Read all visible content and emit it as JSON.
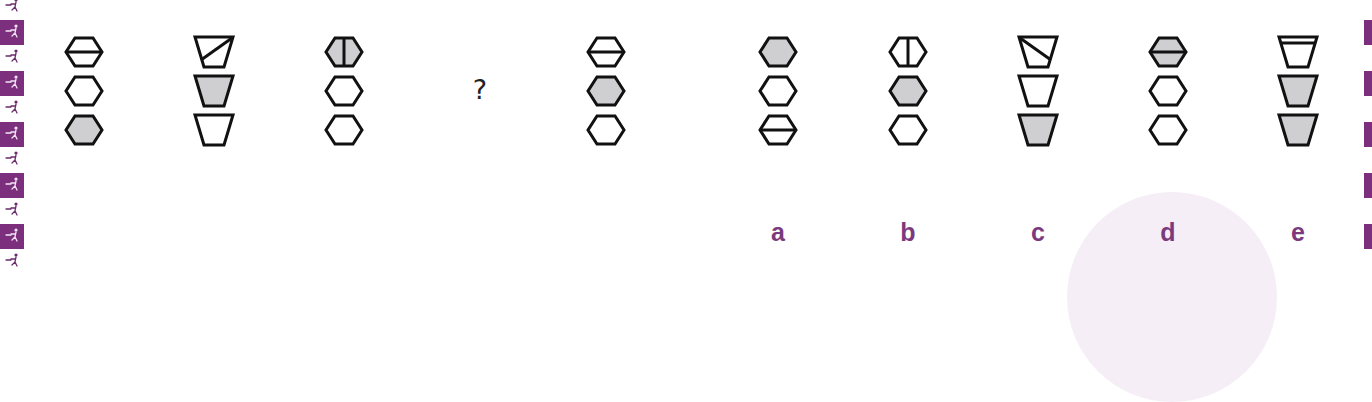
{
  "colors": {
    "accent": "#7b3a7e",
    "strip_purple": "#7b2f7d",
    "shape_fill_gray": "#cfcfd2",
    "shape_stroke": "#111111",
    "circle_bg": "#f6eef7"
  },
  "question": {
    "sequence": [
      {
        "id": "seq-1",
        "shapes": [
          {
            "type": "hexagon",
            "fill": "none",
            "line": "horizontal",
            "half_fill": null
          },
          {
            "type": "hexagon",
            "fill": "none",
            "line": null,
            "half_fill": null
          },
          {
            "type": "hexagon",
            "fill": "gray",
            "line": null,
            "half_fill": null
          }
        ]
      },
      {
        "id": "seq-2",
        "shapes": [
          {
            "type": "trapezoid",
            "fill": "none",
            "line": "diagonal-tr-bl",
            "half_fill": null
          },
          {
            "type": "trapezoid",
            "fill": "gray",
            "line": null,
            "half_fill": null
          },
          {
            "type": "trapezoid",
            "fill": "none",
            "line": null,
            "half_fill": null
          }
        ]
      },
      {
        "id": "seq-3",
        "shapes": [
          {
            "type": "hexagon",
            "fill": "gray",
            "line": "vertical",
            "half_fill": null
          },
          {
            "type": "hexagon",
            "fill": "none",
            "line": null,
            "half_fill": null
          },
          {
            "type": "hexagon",
            "fill": "none",
            "line": null,
            "half_fill": null
          }
        ]
      }
    ],
    "missing_symbol": "?",
    "after": [
      {
        "id": "seq-5",
        "shapes": [
          {
            "type": "hexagon",
            "fill": "none",
            "line": "horizontal",
            "half_fill": null
          },
          {
            "type": "hexagon",
            "fill": "gray",
            "line": null,
            "half_fill": null
          },
          {
            "type": "hexagon",
            "fill": "none",
            "line": null,
            "half_fill": null
          }
        ]
      }
    ]
  },
  "options": [
    {
      "label": "a",
      "shapes": [
        {
          "type": "hexagon",
          "fill": "gray",
          "line": null
        },
        {
          "type": "hexagon",
          "fill": "none",
          "line": null
        },
        {
          "type": "hexagon",
          "fill": "none",
          "line": "horizontal"
        }
      ]
    },
    {
      "label": "b",
      "shapes": [
        {
          "type": "hexagon",
          "fill": "none",
          "line": "vertical"
        },
        {
          "type": "hexagon",
          "fill": "gray",
          "line": null
        },
        {
          "type": "hexagon",
          "fill": "none",
          "line": null
        }
      ]
    },
    {
      "label": "c",
      "shapes": [
        {
          "type": "trapezoid",
          "fill": "none",
          "line": "diagonal-tl-br"
        },
        {
          "type": "trapezoid",
          "fill": "none",
          "line": null
        },
        {
          "type": "trapezoid",
          "fill": "gray",
          "line": null
        }
      ]
    },
    {
      "label": "d",
      "shapes": [
        {
          "type": "hexagon",
          "fill": "gray",
          "line": "horizontal"
        },
        {
          "type": "hexagon",
          "fill": "none",
          "line": null
        },
        {
          "type": "hexagon",
          "fill": "none",
          "line": null
        }
      ]
    },
    {
      "label": "e",
      "shapes": [
        {
          "type": "trapezoid",
          "fill": "none",
          "line": "horizontal-top"
        },
        {
          "type": "trapezoid",
          "fill": "gray",
          "line": null
        },
        {
          "type": "trapezoid",
          "fill": "gray",
          "line": null
        }
      ]
    }
  ],
  "layout": {
    "question_columns_x": [
      84,
      214,
      344,
      606
    ],
    "option_columns_x": [
      778,
      908,
      1038,
      1168,
      1298
    ],
    "shape_rows_y": [
      52,
      91,
      130
    ]
  }
}
